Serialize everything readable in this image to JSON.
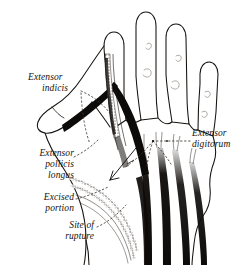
{
  "figure": {
    "background_color": "#ffffff",
    "ink_color": "#15120f"
  },
  "labels": {
    "extensor_indicis": {
      "line1": "Extensor",
      "line2": "indicis"
    },
    "extensor_pollicis_longus": {
      "line1": "Extensor",
      "line2": "pollicis",
      "line3": "longus"
    },
    "excised_portion": {
      "line1": "Excised",
      "line2": "portion"
    },
    "site_of_rupture": {
      "line1": "Site of",
      "line2": "rupture"
    },
    "extensor_digitorum": {
      "line1": "Extensor",
      "line2": "digitorum"
    }
  }
}
